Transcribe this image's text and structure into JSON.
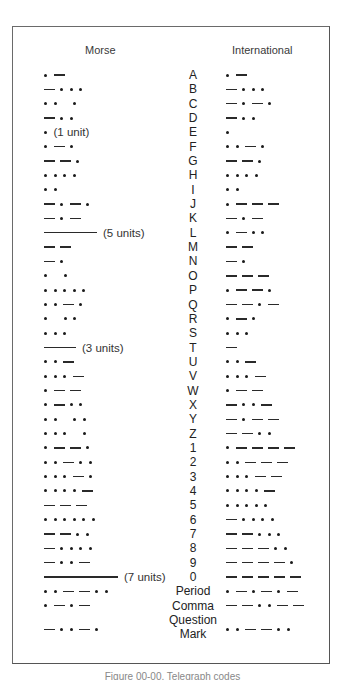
{
  "figure": {
    "headers": {
      "morse": "Morse",
      "international": "International"
    },
    "legend_symbols": {
      "dot": "dot-symbol",
      "dash": "dash-symbol",
      "gap": "space",
      "line": "long-dash-symbol"
    },
    "rows": [
      {
        "char": "A",
        "morse": ". -",
        "international": ". -"
      },
      {
        "char": "B",
        "morse": "- . . .",
        "international": "- . . ."
      },
      {
        "char": "C",
        "morse": ". . _ .",
        "international": "- . - ."
      },
      {
        "char": "D",
        "morse": "- . .",
        "international": "- . ."
      },
      {
        "char": "E",
        "morse": ".",
        "morse_note": "(1 unit)",
        "international": "."
      },
      {
        "char": "F",
        "morse": ". - .",
        "international": ". . - ."
      },
      {
        "char": "G",
        "morse": "- - .",
        "international": "- - ."
      },
      {
        "char": "H",
        "morse": ". . . .",
        "international": ". . . ."
      },
      {
        "char": "I",
        "morse": ". .",
        "international": ". ."
      },
      {
        "char": "J",
        "morse": "- . - .",
        "international": ". - - -"
      },
      {
        "char": "K",
        "morse": "- . -",
        "international": "- . -"
      },
      {
        "char": "L",
        "morse": "L5",
        "morse_note": "(5 units)",
        "international": ". - . ."
      },
      {
        "char": "M",
        "morse": "- -",
        "international": "- -"
      },
      {
        "char": "N",
        "morse": "- .",
        "international": "- ."
      },
      {
        "char": "O",
        "morse": ". _ .",
        "international": "- - -"
      },
      {
        "char": "P",
        "morse": ". . . . .",
        "international": ". - - ."
      },
      {
        "char": "Q",
        "morse": ". . - .",
        "international": "- - . -"
      },
      {
        "char": "R",
        "morse": ". _ . .",
        "international": ". - ."
      },
      {
        "char": "S",
        "morse": ". . .",
        "international": ". . ."
      },
      {
        "char": "T",
        "morse": "L3",
        "morse_note": "(3 units)",
        "international": "-"
      },
      {
        "char": "U",
        "morse": ". . -",
        "international": ". . -"
      },
      {
        "char": "V",
        "morse": ". . . -",
        "international": ". . . -"
      },
      {
        "char": "W",
        "morse": ". - -",
        "international": ". - -"
      },
      {
        "char": "X",
        "morse": ". - . .",
        "international": "- . . -"
      },
      {
        "char": "Y",
        "morse": ". . _ . .",
        "international": "- . - -"
      },
      {
        "char": "Z",
        "morse": ". . . _ .",
        "international": "- - . ."
      },
      {
        "char": "1",
        "morse": ". - - .",
        "international": ". - - - -"
      },
      {
        "char": "2",
        "morse": ". . - . .",
        "international": ". . - - -"
      },
      {
        "char": "3",
        "morse": ". . . - .",
        "international": ". . . - -"
      },
      {
        "char": "4",
        "morse": ". . . . -",
        "international": ". . . . -"
      },
      {
        "char": "5",
        "morse": "- - -",
        "international": ". . . . ."
      },
      {
        "char": "6",
        "morse": ". . . . . .",
        "international": "- . . . ."
      },
      {
        "char": "7",
        "morse": "- - . .",
        "international": "- - . . ."
      },
      {
        "char": "8",
        "morse": "- . . . .",
        "international": "- - - . ."
      },
      {
        "char": "9",
        "morse": "- . . -",
        "international": "- - - - ."
      },
      {
        "char": "0",
        "morse": "L7",
        "morse_note": "(7 units)",
        "international": "- - - - -"
      },
      {
        "char": "Period",
        "morse": ". . - - . .",
        "international": ". - . - . -"
      },
      {
        "char": "Comma",
        "morse": ". - . -",
        "international": "- - . . - -"
      },
      {
        "char": "Question",
        "morse": "",
        "international": ""
      },
      {
        "char": "Mark",
        "morse": "- . . - .",
        "international": ". . - - . ."
      }
    ],
    "caption": "Figure 00-00. Telegraph codes"
  }
}
